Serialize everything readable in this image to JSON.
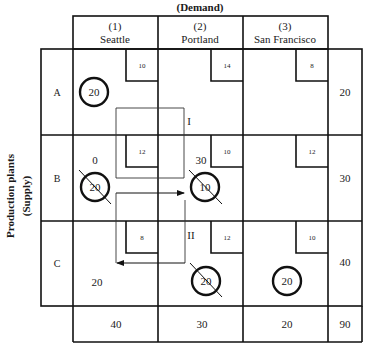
{
  "title": "(Demand)",
  "side_label": {
    "line1": "Production plants",
    "line2": "(Supply)"
  },
  "columns": [
    {
      "num": "(1)",
      "name": "Seattle"
    },
    {
      "num": "(2)",
      "name": "Portland"
    },
    {
      "num": "(3)",
      "name": "San Francisco"
    }
  ],
  "rows": [
    {
      "label": "A",
      "supply": "20",
      "cells": [
        {
          "cost": "10",
          "alloc": "20",
          "circled": true,
          "crossed": false,
          "note": ""
        },
        {
          "cost": "14",
          "alloc": "",
          "circled": false,
          "crossed": false,
          "note": ""
        },
        {
          "cost": "8",
          "alloc": "",
          "circled": false,
          "crossed": false,
          "note": ""
        }
      ]
    },
    {
      "label": "B",
      "supply": "30",
      "cells": [
        {
          "cost": "12",
          "alloc": "20",
          "circled": true,
          "crossed": true,
          "note": "0"
        },
        {
          "cost": "10",
          "alloc": "10",
          "circled": true,
          "crossed": true,
          "note": "30"
        },
        {
          "cost": "12",
          "alloc": "",
          "circled": false,
          "crossed": false,
          "note": ""
        }
      ]
    },
    {
      "label": "C",
      "supply": "40",
      "cells": [
        {
          "cost": "8",
          "alloc": "",
          "circled": false,
          "crossed": false,
          "note": "20"
        },
        {
          "cost": "12",
          "alloc": "20",
          "circled": true,
          "crossed": true,
          "note": ""
        },
        {
          "cost": "10",
          "alloc": "20",
          "circled": true,
          "crossed": false,
          "note": ""
        }
      ]
    }
  ],
  "demand_totals": [
    "40",
    "30",
    "20"
  ],
  "grand_total": "90",
  "loops": {
    "loop1_label": "I",
    "loop2_label": "II"
  }
}
